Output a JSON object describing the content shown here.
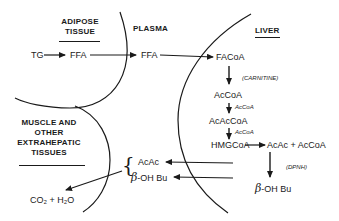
{
  "diagram": {
    "compartments": {
      "adipose": {
        "title_line1": "ADIPOSE",
        "title_line2": "TISSUE"
      },
      "plasma": {
        "title": "PLASMA"
      },
      "liver": {
        "title": "LIVER"
      },
      "muscle": {
        "title_line1": "MUSCLE AND",
        "title_line2": "OTHER",
        "title_line3": "EXTRAHEPATIC",
        "title_line4": "TISSUES"
      }
    },
    "nodes": {
      "tg": "TG",
      "ffa_adipose": "FFA",
      "ffa_plasma": "FFA",
      "facoa": "FACoA",
      "accoa": "AcCoA",
      "acaccoa": "AcAcCoA",
      "hmgcoa": "HMGCoA",
      "acac_liver": "AcAc + AcCoA",
      "beta_symbol": "β",
      "ohbu_liver": "-OH Bu",
      "acac_plasma": "AcAc",
      "ohbu_plasma": "-OH Bu",
      "co2_h2o": "CO₂ + H₂O"
    },
    "cofactors": {
      "carnitine": "(CARNITINE)",
      "accoa_1": "AcCoA",
      "accoa_2": "AcCoA",
      "dpnh": "(DPNH)"
    },
    "brace": "{",
    "edges": [
      {
        "from": "TG",
        "to": "FFA (adipose)"
      },
      {
        "from": "FFA (adipose)",
        "to": "FFA (plasma)"
      },
      {
        "from": "FFA (plasma)",
        "to": "FACoA"
      },
      {
        "from": "FACoA",
        "to": "AcCoA",
        "label": "(CARNITINE)"
      },
      {
        "from": "AcCoA",
        "to": "AcAcCoA",
        "label": "AcCoA"
      },
      {
        "from": "AcAcCoA",
        "to": "HMGCoA",
        "label": "AcCoA"
      },
      {
        "from": "HMGCoA",
        "to": "AcAc + AcCoA"
      },
      {
        "from": "AcAc + AcCoA",
        "to": "β-OH Bu",
        "label": "(DPNH)"
      },
      {
        "from": "liver",
        "to": "AcAc (plasma)"
      },
      {
        "from": "liver",
        "to": "β-OH Bu (plasma)"
      },
      {
        "from": "AcAc / β-OH Bu",
        "to": "CO₂ + H₂O"
      }
    ],
    "colors": {
      "ink": "#1a1a1a",
      "background": "#ffffff"
    }
  }
}
